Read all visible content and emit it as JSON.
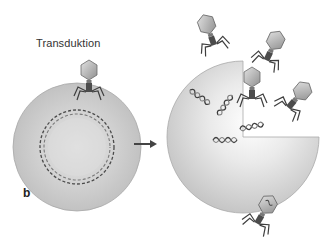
{
  "figure": {
    "title": "Transduktion",
    "panel_label": "b",
    "colors": {
      "cell_fill": "#c9c9c9",
      "cell_highlight": "#f4f4f4",
      "dna": "#4a4a4a",
      "phage_head": "#b8b8b8",
      "phage_body": "#555555",
      "arrow": "#444444"
    },
    "elements": [
      {
        "type": "bacterial-cell",
        "state": "infected",
        "description": "Cell with circular DNA, phage attached on top"
      },
      {
        "type": "arrow",
        "direction": "right"
      },
      {
        "type": "bacterial-cell",
        "state": "lysed",
        "description": "Cell with quadrant opened, fragmented DNA"
      },
      {
        "type": "phage",
        "count": 5,
        "description": "Released phages, one carrying bacterial DNA"
      }
    ]
  }
}
